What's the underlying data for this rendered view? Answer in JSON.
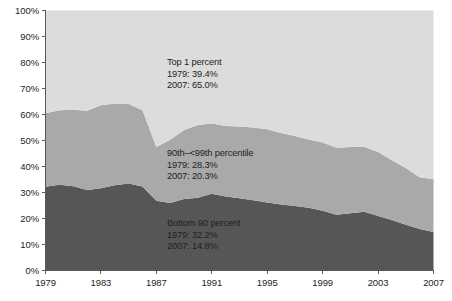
{
  "chart_data": {
    "type": "area",
    "title": "",
    "subtitle": "",
    "xlabel": "",
    "ylabel": "",
    "stacked": true,
    "grid": false,
    "legend_position": "inline-annotations",
    "ylim": [
      0,
      100
    ],
    "xlim": [
      1979,
      2007
    ],
    "y_ticks": [
      "0%",
      "10%",
      "20%",
      "30%",
      "40%",
      "50%",
      "60%",
      "70%",
      "80%",
      "90%",
      "100%"
    ],
    "y_tick_values": [
      0,
      10,
      20,
      30,
      40,
      50,
      60,
      70,
      80,
      90,
      100
    ],
    "x_ticks": [
      "1979",
      "1983",
      "1987",
      "1991",
      "1995",
      "1999",
      "2003",
      "2007"
    ],
    "x_tick_values": [
      1979,
      1983,
      1987,
      1991,
      1995,
      1999,
      2003,
      2007
    ],
    "x": [
      1979,
      1980,
      1981,
      1982,
      1983,
      1984,
      1985,
      1986,
      1987,
      1988,
      1989,
      1990,
      1991,
      1992,
      1993,
      1994,
      1995,
      1996,
      1997,
      1998,
      1999,
      2000,
      2001,
      2002,
      2003,
      2004,
      2005,
      2006,
      2007
    ],
    "series": [
      {
        "name": "Bottom 90 percent",
        "color": "#565656",
        "stack_order": 1,
        "values": [
          32.2,
          33.0,
          32.4,
          31.0,
          31.6,
          32.8,
          33.5,
          32.3,
          26.8,
          26.0,
          27.5,
          28.0,
          29.5,
          28.5,
          27.8,
          27.0,
          26.2,
          25.4,
          24.8,
          24.1,
          23.0,
          21.4,
          22.0,
          22.6,
          21.0,
          19.4,
          17.6,
          16.0,
          14.8
        ]
      },
      {
        "name": "90th–<99th percentile",
        "color": "#a9a9a9",
        "stack_order": 2,
        "values": [
          28.3,
          28.6,
          29.4,
          30.4,
          32.0,
          31.4,
          30.5,
          29.3,
          20.7,
          24.3,
          26.5,
          28.0,
          27.0,
          27.1,
          27.6,
          28.0,
          28.1,
          27.5,
          26.9,
          26.3,
          26.2,
          25.8,
          25.5,
          25.0,
          24.6,
          23.0,
          21.8,
          19.9,
          20.3
        ]
      },
      {
        "name": "Top 1 percent",
        "color": "#dcdcdc",
        "stack_order": 3,
        "values": [
          39.5,
          38.4,
          38.2,
          38.6,
          36.4,
          35.8,
          36.0,
          38.4,
          52.5,
          49.7,
          46.0,
          44.0,
          43.5,
          44.4,
          44.6,
          45.0,
          45.7,
          47.1,
          48.3,
          49.6,
          50.8,
          52.8,
          52.5,
          52.4,
          54.4,
          57.6,
          60.6,
          64.1,
          64.9
        ]
      }
    ],
    "annotations": [
      {
        "id": "top-1-percent",
        "title": "Top 1 percent",
        "rows": [
          "1979: 39.4%",
          "2007: 65.0%"
        ],
        "x_px": 167,
        "y_px": 57
      },
      {
        "id": "90th-99th-percentile",
        "title": "90th–<99th percentile",
        "rows": [
          "1979: 28.3%",
          "2007: 20.3%"
        ],
        "x_px": 167,
        "y_px": 148
      },
      {
        "id": "bottom-90-percent",
        "title": "Bottom 90 percent",
        "rows": [
          "1979: 32.2%",
          "2007: 14.8%"
        ],
        "x_px": 167,
        "y_px": 218
      }
    ],
    "colors": {
      "band_top": "#dcdcdc",
      "band_middle": "#a9a9a9",
      "band_bottom": "#565656",
      "axis": "#58595b",
      "text": "#231f20",
      "background": "#ffffff"
    }
  }
}
